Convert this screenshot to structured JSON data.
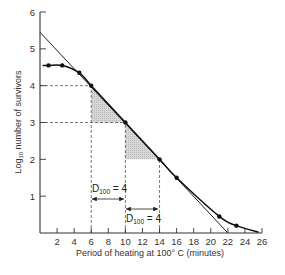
{
  "chart_data": {
    "type": "line",
    "title": "",
    "xlabel": "Period of heating at 100° C (minutes)",
    "ylabel": "Log10 number of survivors",
    "ylabel_main": "Log",
    "ylabel_sub": "10",
    "ylabel_rest": " number of survivors",
    "xlim": [
      0,
      26
    ],
    "ylim": [
      0,
      6
    ],
    "x_ticks": [
      2,
      4,
      6,
      8,
      10,
      12,
      14,
      16,
      18,
      20,
      22,
      24,
      26
    ],
    "y_ticks": [
      1,
      2,
      3,
      4,
      5,
      6
    ],
    "grid": false,
    "series": [
      {
        "name": "Survivor curve (observed)",
        "points": [
          {
            "x": 1,
            "y": 4.55
          },
          {
            "x": 2.6,
            "y": 4.55
          },
          {
            "x": 4.6,
            "y": 4.35
          },
          {
            "x": 6,
            "y": 4.0
          },
          {
            "x": 10,
            "y": 3.0
          },
          {
            "x": 14,
            "y": 2.0
          },
          {
            "x": 16,
            "y": 1.5
          },
          {
            "x": 21,
            "y": 0.45
          },
          {
            "x": 23,
            "y": 0.2
          }
        ]
      },
      {
        "name": "Extrapolated straight line",
        "points": [
          {
            "x": 0,
            "y": 5.45
          },
          {
            "x": 22,
            "y": 0
          }
        ]
      }
    ],
    "annotations": [
      {
        "text": "D100 = 4",
        "from_x": 6,
        "to_x": 10
      },
      {
        "text": "D100 = 4",
        "from_x": 10,
        "to_x": 14
      }
    ],
    "shaded_triangles": [
      {
        "vertices": [
          [
            6,
            4
          ],
          [
            6,
            3
          ],
          [
            10,
            3
          ]
        ]
      },
      {
        "vertices": [
          [
            10,
            3
          ],
          [
            10,
            2
          ],
          [
            14,
            2
          ]
        ]
      }
    ],
    "reference_lines": [
      {
        "y": 4,
        "x_to": 6
      },
      {
        "y": 3,
        "x_to": 10
      },
      {
        "x": 6
      },
      {
        "x": 10
      },
      {
        "x": 14
      }
    ]
  },
  "annotations": {
    "d1": {
      "main": "D",
      "sub": "100",
      "rest": " = 4"
    },
    "d2": {
      "main": "D",
      "sub": "100",
      "rest": " = 4"
    }
  }
}
